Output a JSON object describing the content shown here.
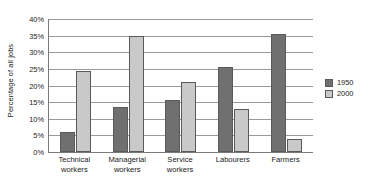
{
  "chart_data": {
    "type": "bar",
    "title": "",
    "subtitle": "",
    "xlabel": "",
    "ylabel": "Percentage of all jobs",
    "categories": [
      "Technical workers",
      "Managerial workers",
      "Service workers",
      "Labourers",
      "Farmers"
    ],
    "category_lines": [
      [
        "Technical",
        "workers"
      ],
      [
        "Managerial",
        "workers"
      ],
      [
        "Service",
        "workers"
      ],
      [
        "Labourers",
        ""
      ],
      [
        "Farmers",
        ""
      ]
    ],
    "series": [
      {
        "name": "1950",
        "color": "#707070",
        "values": [
          6,
          13.5,
          15.5,
          25.5,
          35.5
        ]
      },
      {
        "name": "2000",
        "color": "#c9c9c9",
        "values": [
          24.5,
          35,
          21,
          13,
          4
        ]
      }
    ],
    "ylim": [
      0,
      40
    ],
    "ytick_values": [
      0,
      5,
      10,
      15,
      20,
      25,
      30,
      35,
      40
    ],
    "ytick_labels": [
      "0%",
      "5%",
      "10%",
      "15%",
      "20%",
      "25%",
      "30%",
      "35%",
      "40%"
    ],
    "grid": true,
    "grid_axis": "y",
    "legend_position": "right",
    "legend_entries": [
      "1950",
      "2000"
    ]
  }
}
